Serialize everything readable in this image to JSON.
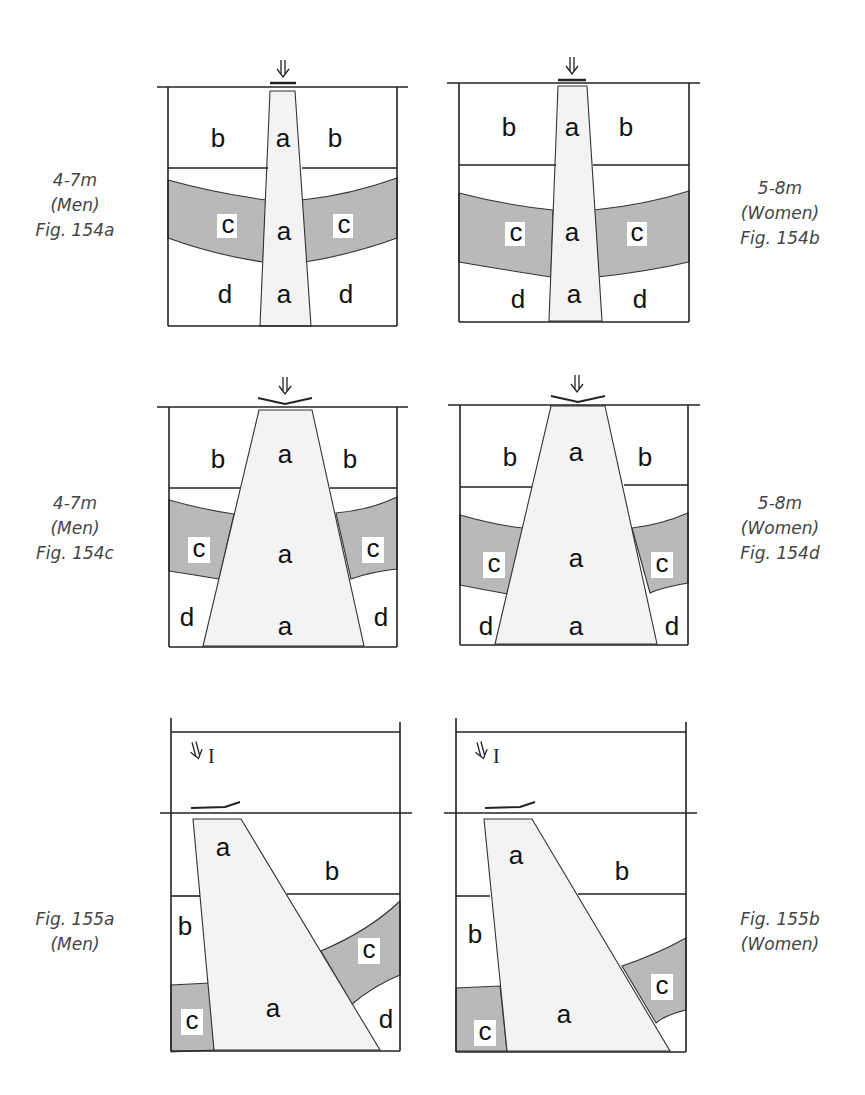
{
  "figures": [
    {
      "id": "154a",
      "caption": [
        "4-7m",
        "(Men)",
        "Fig. 154a"
      ],
      "labels": {
        "a": "a",
        "b": "b",
        "c": "c",
        "d": "d"
      }
    },
    {
      "id": "154b",
      "caption": [
        "5-8m",
        "(Women)",
        "Fig. 154b"
      ],
      "labels": {
        "a": "a",
        "b": "b",
        "c": "c",
        "d": "d"
      }
    },
    {
      "id": "154c",
      "caption": [
        "4-7m",
        "(Men)",
        "Fig. 154c"
      ],
      "labels": {
        "a": "a",
        "b": "b",
        "c": "c",
        "d": "d"
      }
    },
    {
      "id": "154d",
      "caption": [
        "5-8m",
        "(Women)",
        "Fig. 154d"
      ],
      "labels": {
        "a": "a",
        "b": "b",
        "c": "c",
        "d": "d"
      }
    },
    {
      "id": "155a",
      "caption": [
        "Fig. 155a",
        "(Men)"
      ],
      "labels": {
        "a": "a",
        "b": "b",
        "c": "c",
        "d": "d"
      },
      "incidence": "I"
    },
    {
      "id": "155b",
      "caption": [
        "Fig. 155b",
        "(Women)"
      ],
      "labels": {
        "a": "a",
        "b": "b",
        "c": "c"
      },
      "incidence": "I"
    }
  ],
  "colors": {
    "zone_c": "#b9b9b9",
    "zone_a": "#f3f3f3",
    "lines": "#222222"
  }
}
